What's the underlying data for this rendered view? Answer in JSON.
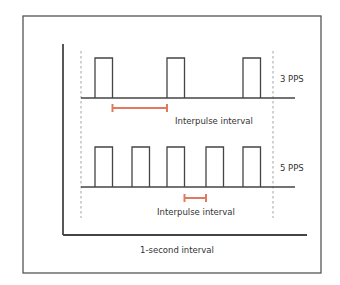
{
  "diagram": {
    "type": "pulse-timing",
    "rows": [
      {
        "id": "row-3pps",
        "rate_label": "3 PPS",
        "pulses_per_second": 3,
        "pulse_slots": [
          0,
          2,
          4
        ],
        "interval_label": "Interpulse interval",
        "interval_between_slots": [
          0,
          2
        ]
      },
      {
        "id": "row-5pps",
        "rate_label": "5 PPS",
        "pulses_per_second": 5,
        "pulse_slots": [
          0,
          1,
          2,
          3,
          4
        ],
        "interval_label": "Interpulse interval",
        "interval_between_slots": [
          2,
          3
        ]
      }
    ],
    "x_axis_label": "1-second interval",
    "colors": {
      "line": "#444444",
      "interval_marker": "#e07a5f",
      "dashed": "#999999",
      "frame": "#555555"
    }
  }
}
